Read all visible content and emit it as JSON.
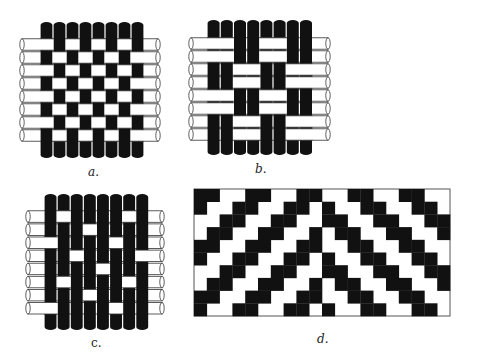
{
  "figure": {
    "background": "#ffffff",
    "warp_color": "#111111",
    "weft_color": "#ffffff",
    "outline_color": "#333333",
    "panels": [
      {
        "id": "a",
        "label": "a.",
        "label_italic": true,
        "label_pos": [
          88,
          166
        ],
        "type": "woven",
        "weave": "plain weave",
        "rows": 8,
        "cols": 8,
        "warp_x0": 40,
        "warp_w": 13,
        "warp_top": 22,
        "warp_bottom": 158,
        "weft_y0": 38,
        "weft_h": 13,
        "weft_left": 22,
        "weft_right": 158,
        "grid": [
          [
            0,
            1,
            0,
            1,
            0,
            1,
            0,
            1
          ],
          [
            1,
            0,
            1,
            0,
            1,
            0,
            1,
            0
          ],
          [
            0,
            1,
            0,
            1,
            0,
            1,
            0,
            1
          ],
          [
            1,
            0,
            1,
            0,
            1,
            0,
            1,
            0
          ],
          [
            0,
            1,
            0,
            1,
            0,
            1,
            0,
            1
          ],
          [
            1,
            0,
            1,
            0,
            1,
            0,
            1,
            0
          ],
          [
            0,
            1,
            0,
            1,
            0,
            1,
            0,
            1
          ],
          [
            1,
            0,
            1,
            0,
            1,
            0,
            1,
            0
          ]
        ]
      },
      {
        "id": "b",
        "label": "b.",
        "label_italic": true,
        "label_pos": [
          255,
          163
        ],
        "type": "woven",
        "weave": "basket weave",
        "rows": 8,
        "cols": 8,
        "warp_x0": 207,
        "warp_w": 13.2,
        "warp_top": 20,
        "warp_bottom": 155,
        "weft_y0": 37,
        "weft_h": 13,
        "weft_left": 191,
        "weft_right": 328,
        "grid": [
          [
            0,
            0,
            1,
            1,
            0,
            0,
            1,
            1
          ],
          [
            0,
            0,
            1,
            1,
            0,
            0,
            1,
            1
          ],
          [
            1,
            1,
            0,
            0,
            1,
            1,
            0,
            0
          ],
          [
            1,
            1,
            0,
            0,
            1,
            1,
            0,
            0
          ],
          [
            0,
            0,
            1,
            1,
            0,
            0,
            1,
            1
          ],
          [
            0,
            0,
            1,
            1,
            0,
            0,
            1,
            1
          ],
          [
            1,
            1,
            0,
            0,
            1,
            1,
            0,
            0
          ],
          [
            1,
            1,
            0,
            0,
            1,
            1,
            0,
            0
          ]
        ]
      },
      {
        "id": "c",
        "label": "c.",
        "label_italic": false,
        "label_pos": [
          91,
          337
        ],
        "type": "woven",
        "weave": "satin weave",
        "rows": 8,
        "cols": 8,
        "warp_x0": 44,
        "warp_w": 13.1,
        "warp_top": 194,
        "warp_bottom": 330,
        "weft_y0": 210,
        "weft_h": 13.1,
        "weft_left": 28,
        "weft_right": 162,
        "grid": [
          [
            1,
            0,
            1,
            1,
            1,
            1,
            0,
            1
          ],
          [
            1,
            1,
            1,
            0,
            1,
            1,
            1,
            1
          ],
          [
            0,
            1,
            1,
            1,
            1,
            0,
            1,
            1
          ],
          [
            1,
            1,
            0,
            1,
            1,
            1,
            1,
            0
          ],
          [
            1,
            1,
            1,
            1,
            0,
            1,
            1,
            1
          ],
          [
            1,
            0,
            1,
            1,
            1,
            1,
            0,
            1
          ],
          [
            1,
            1,
            1,
            0,
            1,
            1,
            1,
            1
          ],
          [
            0,
            1,
            1,
            1,
            1,
            0,
            1,
            1
          ]
        ]
      },
      {
        "id": "d",
        "label": "d.",
        "label_italic": true,
        "label_pos": [
          317,
          333
        ],
        "type": "draft",
        "weave": "chevron twill draft",
        "rows": 10,
        "cols": 20,
        "x": 194,
        "y": 189,
        "width": 256,
        "height": 127,
        "grid": [
          [
            1,
            1,
            0,
            0,
            1,
            1,
            0,
            0,
            1,
            1,
            0,
            0,
            1,
            1,
            0,
            0,
            1,
            1,
            0,
            0
          ],
          [
            1,
            0,
            0,
            1,
            1,
            0,
            0,
            1,
            1,
            0,
            1,
            0,
            0,
            1,
            1,
            0,
            0,
            1,
            1,
            0
          ],
          [
            0,
            0,
            1,
            1,
            0,
            0,
            1,
            1,
            0,
            0,
            1,
            1,
            0,
            0,
            1,
            1,
            0,
            0,
            1,
            1
          ],
          [
            0,
            1,
            1,
            0,
            0,
            1,
            1,
            0,
            0,
            1,
            0,
            1,
            1,
            0,
            0,
            1,
            1,
            0,
            0,
            1
          ],
          [
            1,
            1,
            0,
            0,
            1,
            1,
            0,
            0,
            1,
            1,
            0,
            0,
            1,
            1,
            0,
            0,
            1,
            1,
            0,
            0
          ],
          [
            1,
            0,
            0,
            1,
            1,
            0,
            0,
            1,
            1,
            0,
            1,
            0,
            0,
            1,
            1,
            0,
            0,
            1,
            1,
            0
          ],
          [
            0,
            0,
            1,
            1,
            0,
            0,
            1,
            1,
            0,
            0,
            1,
            1,
            0,
            0,
            1,
            1,
            0,
            0,
            1,
            1
          ],
          [
            0,
            1,
            1,
            0,
            0,
            1,
            1,
            0,
            0,
            1,
            0,
            1,
            1,
            0,
            0,
            1,
            1,
            0,
            0,
            1
          ],
          [
            1,
            1,
            0,
            0,
            1,
            1,
            0,
            0,
            1,
            1,
            0,
            0,
            1,
            1,
            0,
            0,
            1,
            1,
            0,
            0
          ],
          [
            1,
            0,
            0,
            1,
            1,
            0,
            0,
            1,
            1,
            0,
            1,
            0,
            0,
            1,
            1,
            0,
            0,
            1,
            1,
            0
          ]
        ]
      }
    ]
  }
}
